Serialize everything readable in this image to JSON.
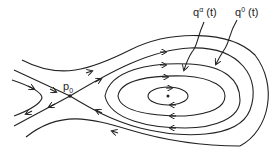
{
  "figure": {
    "type": "phase portrait with saddle point and center",
    "labels": {
      "saddle": {
        "base": "p",
        "sub": "0"
      },
      "orbit_alpha": {
        "base": "q",
        "sup": "α",
        "arg": " (t)"
      },
      "orbit_zero": {
        "base": "q",
        "sup": "0",
        "arg": " (t)"
      }
    },
    "stroke_color": "#222222",
    "background": "#ffffff"
  }
}
